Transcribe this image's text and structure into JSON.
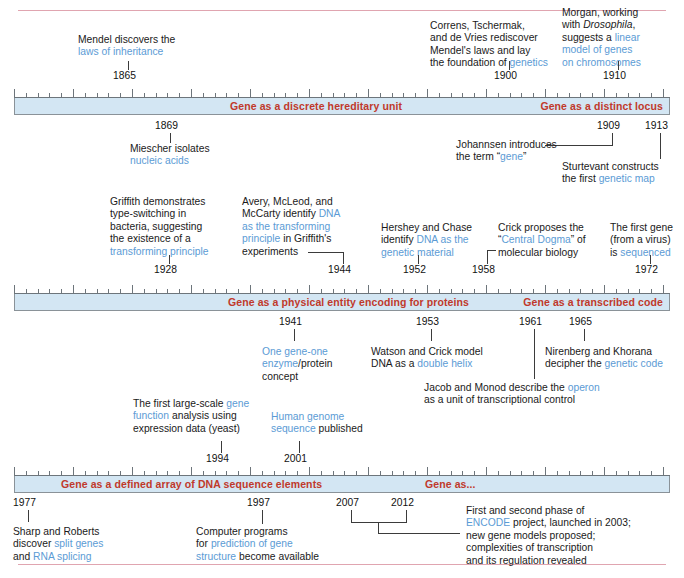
{
  "figure": {
    "colors": {
      "bar_fill": "#d3e6f3",
      "bar_border": "#8a9298",
      "bar_label": "#c0392b",
      "highlight_text": "#5b9bd5",
      "body_text": "#1a1a1a",
      "rule": "#e0a5b0"
    }
  },
  "bands": [
    {
      "id": "band-1",
      "range": [
        1860,
        1915
      ],
      "labels": [
        {
          "text": "Gene as a discrete hereditary unit"
        },
        {
          "text": "Gene as a distinct locus"
        }
      ],
      "events_above": [
        {
          "year": "1865",
          "lines": [
            [
              {
                "t": "Mendel discovers the",
                "hl": false
              }
            ],
            [
              {
                "t": "laws of inheritance",
                "hl": true
              }
            ]
          ]
        },
        {
          "year": "1900",
          "lines": [
            [
              {
                "t": "Correns, Tschermak,",
                "hl": false
              }
            ],
            [
              {
                "t": "and de Vries rediscover",
                "hl": false
              }
            ],
            [
              {
                "t": "Mendel's laws and lay",
                "hl": false
              }
            ],
            [
              {
                "t": "the foundation of ",
                "hl": false
              },
              {
                "t": "genetics",
                "hl": true
              }
            ]
          ]
        },
        {
          "year": "1910",
          "lines": [
            [
              {
                "t": "Morgan, working",
                "hl": false
              }
            ],
            [
              {
                "t": "with ",
                "hl": false
              },
              {
                "t": "Drosophila",
                "hl": false,
                "it": true
              },
              {
                "t": ",",
                "hl": false
              }
            ],
            [
              {
                "t": "suggests a ",
                "hl": false
              },
              {
                "t": "linear",
                "hl": true
              }
            ],
            [
              {
                "t": "model of genes",
                "hl": true
              }
            ],
            [
              {
                "t": "on chromosomes",
                "hl": true
              }
            ]
          ]
        }
      ],
      "events_below": [
        {
          "year": "1869",
          "lines": [
            [
              {
                "t": "Miescher isolates",
                "hl": false
              }
            ],
            [
              {
                "t": "nucleic acids",
                "hl": true
              }
            ]
          ]
        },
        {
          "year": "1909",
          "lines": [
            [
              {
                "t": "Johannsen introduces",
                "hl": false
              }
            ],
            [
              {
                "t": "the term “",
                "hl": false
              },
              {
                "t": "gene",
                "hl": true
              },
              {
                "t": "”",
                "hl": false
              }
            ]
          ]
        },
        {
          "year": "1913",
          "lines": [
            [
              {
                "t": "Sturtevant constructs",
                "hl": false
              }
            ],
            [
              {
                "t": "the first ",
                "hl": false
              },
              {
                "t": "genetic map",
                "hl": true
              }
            ]
          ]
        }
      ]
    },
    {
      "id": "band-2",
      "range": [
        1925,
        1975
      ],
      "labels": [
        {
          "text": "Gene as a physical entity encoding for proteins"
        },
        {
          "text": "Gene as a transcribed code"
        }
      ],
      "events_above": [
        {
          "year": "1928",
          "lines": [
            [
              {
                "t": "Griffith demonstrates",
                "hl": false
              }
            ],
            [
              {
                "t": "type-switching in",
                "hl": false
              }
            ],
            [
              {
                "t": "bacteria, suggesting",
                "hl": false
              }
            ],
            [
              {
                "t": "the existence of a",
                "hl": false
              }
            ],
            [
              {
                "t": "transforming principle",
                "hl": true
              }
            ]
          ]
        },
        {
          "year": "1944",
          "lines": [
            [
              {
                "t": "Avery, McLeod, and",
                "hl": false
              }
            ],
            [
              {
                "t": "McCarty identify ",
                "hl": false
              },
              {
                "t": "DNA",
                "hl": true
              }
            ],
            [
              {
                "t": "as the transforming",
                "hl": true
              }
            ],
            [
              {
                "t": "principle",
                "hl": true
              },
              {
                "t": " in Griffith's",
                "hl": false
              }
            ],
            [
              {
                "t": "experiments",
                "hl": false
              }
            ]
          ]
        },
        {
          "year": "1952",
          "lines": [
            [
              {
                "t": "Hershey and Chase",
                "hl": false
              }
            ],
            [
              {
                "t": "identify ",
                "hl": false
              },
              {
                "t": "DNA as the",
                "hl": true
              }
            ],
            [
              {
                "t": "genetic material",
                "hl": true
              }
            ]
          ]
        },
        {
          "year": "1958",
          "lines": [
            [
              {
                "t": "Crick proposes the",
                "hl": false
              }
            ],
            [
              {
                "t": "“",
                "hl": false
              },
              {
                "t": "Central Dogma",
                "hl": true
              },
              {
                "t": "” of",
                "hl": false
              }
            ],
            [
              {
                "t": "molecular biology",
                "hl": false
              }
            ]
          ]
        },
        {
          "year": "1972",
          "lines": [
            [
              {
                "t": "The first gene",
                "hl": false
              }
            ],
            [
              {
                "t": "(from a virus)",
                "hl": false
              }
            ],
            [
              {
                "t": "is ",
                "hl": false
              },
              {
                "t": "sequenced",
                "hl": true
              }
            ]
          ]
        }
      ],
      "events_below": [
        {
          "year": "1941",
          "lines": [
            [
              {
                "t": "One gene-one",
                "hl": true
              }
            ],
            [
              {
                "t": "enzyme",
                "hl": true
              },
              {
                "t": "/protein",
                "hl": false
              }
            ],
            [
              {
                "t": "concept",
                "hl": false
              }
            ]
          ]
        },
        {
          "year": "1953",
          "lines": [
            [
              {
                "t": "Watson and Crick model",
                "hl": false
              }
            ],
            [
              {
                "t": "DNA as a ",
                "hl": false
              },
              {
                "t": "double helix",
                "hl": true
              }
            ]
          ]
        },
        {
          "year": "1961",
          "lines": [
            [
              {
                "t": "Jacob and Monod describe the ",
                "hl": false
              },
              {
                "t": "operon",
                "hl": true
              }
            ],
            [
              {
                "t": "as a unit of transcriptional control",
                "hl": false
              }
            ]
          ]
        },
        {
          "year": "1965",
          "lines": [
            [
              {
                "t": "Nirenberg and Khorana",
                "hl": false
              }
            ],
            [
              {
                "t": "decipher the ",
                "hl": false
              },
              {
                "t": "genetic code",
                "hl": true
              }
            ]
          ]
        }
      ]
    },
    {
      "id": "band-3",
      "range": [
        1975,
        2015
      ],
      "labels": [
        {
          "text": "Gene as a  defined array of DNA sequence elements"
        },
        {
          "text": "Gene as..."
        }
      ],
      "events_above": [
        {
          "year": "1994",
          "lines": [
            [
              {
                "t": "The first large-scale ",
                "hl": false
              },
              {
                "t": "gene",
                "hl": true
              }
            ],
            [
              {
                "t": "function",
                "hl": true
              },
              {
                "t": " analysis using",
                "hl": false
              }
            ],
            [
              {
                "t": "expression data (yeast)",
                "hl": false
              }
            ]
          ]
        },
        {
          "year": "2001",
          "lines": [
            [
              {
                "t": "Human genome",
                "hl": true
              }
            ],
            [
              {
                "t": "sequence",
                "hl": true
              },
              {
                "t": " published",
                "hl": false
              }
            ]
          ]
        }
      ],
      "events_below": [
        {
          "year": "1977",
          "lines": [
            [
              {
                "t": "Sharp and Roberts",
                "hl": false
              }
            ],
            [
              {
                "t": "discover ",
                "hl": false
              },
              {
                "t": "split genes",
                "hl": true
              }
            ],
            [
              {
                "t": "and ",
                "hl": false
              },
              {
                "t": "RNA splicing",
                "hl": true
              }
            ]
          ]
        },
        {
          "year": "1997",
          "lines": [
            [
              {
                "t": "Computer programs",
                "hl": false
              }
            ],
            [
              {
                "t": "for ",
                "hl": false
              },
              {
                "t": "prediction of gene",
                "hl": true
              }
            ],
            [
              {
                "t": "structure",
                "hl": true
              },
              {
                "t": " become available",
                "hl": false
              }
            ]
          ]
        },
        {
          "year": "2007",
          "lines": []
        },
        {
          "year": "2012",
          "lines": []
        },
        {
          "year": "",
          "lines": [
            [
              {
                "t": "First and second phase of",
                "hl": false
              }
            ],
            [
              {
                "t": "ENCODE",
                "hl": true
              },
              {
                "t": " project, launched in 2003;",
                "hl": false
              }
            ],
            [
              {
                "t": "new gene models proposed;",
                "hl": false
              }
            ],
            [
              {
                "t": "complexities of transcription",
                "hl": false
              }
            ],
            [
              {
                "t": "and its regulation revealed",
                "hl": false
              }
            ]
          ]
        }
      ]
    }
  ],
  "chart_data": {
    "type": "timeline",
    "eras": [
      {
        "label": "Gene as a discrete hereditary unit",
        "band": 1
      },
      {
        "label": "Gene as a distinct locus",
        "band": 1
      },
      {
        "label": "Gene as a physical entity encoding for proteins",
        "band": 2
      },
      {
        "label": "Gene as a transcribed code",
        "band": 2
      },
      {
        "label": "Gene as a  defined array of DNA sequence elements",
        "band": 3
      },
      {
        "label": "Gene as...",
        "band": 3
      }
    ],
    "events": [
      {
        "year": 1865,
        "text": "Mendel discovers the laws of inheritance"
      },
      {
        "year": 1869,
        "text": "Miescher isolates nucleic acids"
      },
      {
        "year": 1900,
        "text": "Correns, Tschermak, and de Vries rediscover Mendel's laws and lay the foundation of genetics"
      },
      {
        "year": 1909,
        "text": "Johannsen introduces the term “gene”"
      },
      {
        "year": 1910,
        "text": "Morgan, working with Drosophila, suggests a linear model of genes on chromosomes"
      },
      {
        "year": 1913,
        "text": "Sturtevant constructs the first genetic map"
      },
      {
        "year": 1928,
        "text": "Griffith demonstrates type-switching in bacteria, suggesting the existence of a transforming principle"
      },
      {
        "year": 1941,
        "text": "One gene-one enzyme/protein concept"
      },
      {
        "year": 1944,
        "text": "Avery, McLeod, and McCarty identify DNA as the transforming principle in Griffith's experiments"
      },
      {
        "year": 1952,
        "text": "Hershey and Chase identify DNA as the genetic material"
      },
      {
        "year": 1953,
        "text": "Watson and Crick model DNA as a double helix"
      },
      {
        "year": 1958,
        "text": "Crick proposes the “Central Dogma” of molecular biology"
      },
      {
        "year": 1961,
        "text": "Jacob and Monod describe the operon as a unit of transcriptional control"
      },
      {
        "year": 1965,
        "text": "Nirenberg and Khorana decipher the genetic code"
      },
      {
        "year": 1972,
        "text": "The first gene (from a virus) is sequenced"
      },
      {
        "year": 1977,
        "text": "Sharp and Roberts discover split genes and RNA splicing"
      },
      {
        "year": 1994,
        "text": "The first large-scale gene function analysis using expression data (yeast)"
      },
      {
        "year": 1997,
        "text": "Computer programs for prediction of gene structure become available"
      },
      {
        "year": 2001,
        "text": "Human genome sequence published"
      },
      {
        "year": 2007,
        "text": "First phase of ENCODE project"
      },
      {
        "year": 2012,
        "text": "Second phase of ENCODE project; new gene models proposed; complexities of transcription and its regulation revealed"
      }
    ]
  }
}
